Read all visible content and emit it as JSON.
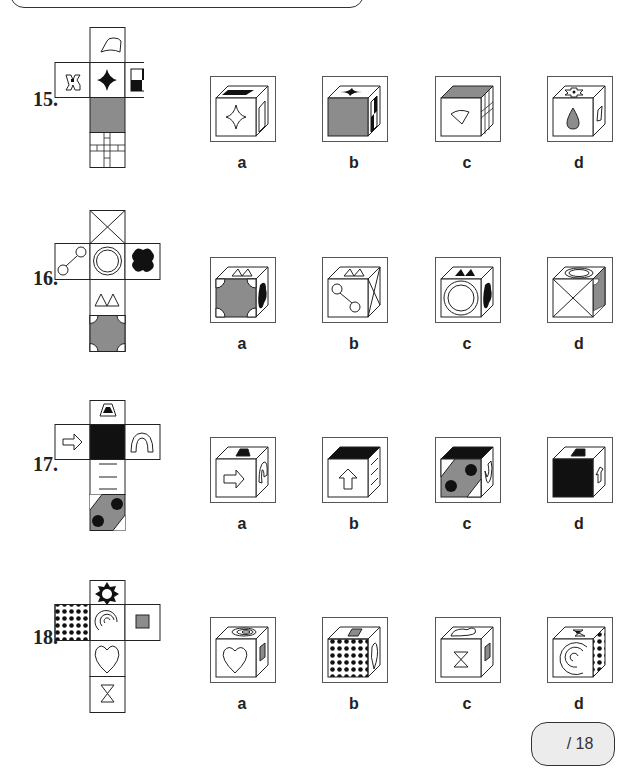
{
  "questions": [
    {
      "number": "15.",
      "options": [
        "a",
        "b",
        "c",
        "d"
      ],
      "net_faces": {
        "top": "fan-shape",
        "left": "cross-with-dot",
        "center": "four-point-star",
        "right": "checkerboard",
        "below": "gray-square",
        "bottom": "grid-cross"
      }
    },
    {
      "number": "16.",
      "options": [
        "a",
        "b",
        "c",
        "d"
      ],
      "net_faces": {
        "top": "x-box",
        "left": "two-linked-circles",
        "center": "double-circle",
        "right": "black-quatrefoil",
        "below": "two-triangles",
        "bottom": "gray-cross-quarter-circles"
      }
    },
    {
      "number": "17.",
      "options": [
        "a",
        "b",
        "c",
        "d"
      ],
      "net_faces": {
        "top": "trapezoid",
        "left": "right-arrow",
        "center": "black-square",
        "right": "arch",
        "below": "three-lines",
        "bottom": "gray-band-two-dots"
      }
    },
    {
      "number": "18.",
      "options": [
        "a",
        "b",
        "c",
        "d"
      ],
      "net_faces": {
        "top": "star-burst",
        "left": "polka-dots",
        "center": "spiral",
        "right": "gray-small-square",
        "below": "heart",
        "bottom": "hourglass"
      }
    }
  ],
  "score": {
    "text": "/ 18"
  },
  "colors": {
    "gray": "#8c8c8c",
    "black": "#111111",
    "line": "#222222"
  }
}
